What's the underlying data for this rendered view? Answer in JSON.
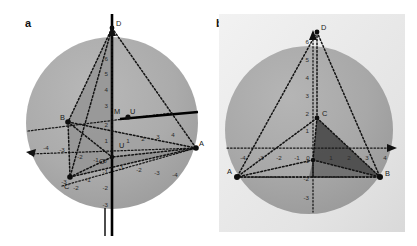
{
  "figure": {
    "caption_panels": [
      "a",
      "b"
    ],
    "background_color": "#ffffff"
  },
  "panels": [
    {
      "id": "a",
      "label": "a",
      "view": "oblique 3D view of a regular tetrahedron inscribed in a sphere",
      "sphere": {
        "fill": "#a9a9a9",
        "center_px": [
          112,
          123
        ],
        "radius_px": 86
      },
      "vertices": [
        {
          "name": "D",
          "label": "D",
          "px": [
            112,
            28
          ]
        },
        {
          "name": "A",
          "label": "A",
          "px": [
            196,
            148
          ]
        },
        {
          "name": "B",
          "label": "B",
          "px": [
            68,
            122
          ]
        },
        {
          "name": "C",
          "label": "C",
          "px": [
            70,
            177
          ]
        },
        {
          "name": "M",
          "label": "M",
          "px": [
            118,
            116
          ]
        },
        {
          "name": "U",
          "label": "U",
          "px": [
            128,
            117
          ]
        },
        {
          "name": "O",
          "label": "O",
          "px": [
            110,
            157
          ]
        },
        {
          "name": "U2",
          "label": "U",
          "px": [
            117,
            145
          ]
        }
      ],
      "axis_ticks": {
        "vertical_positive": [
          "1",
          "2",
          "3",
          "4",
          "5",
          "6"
        ],
        "vertical_negative": [
          "-1",
          "-2",
          "-3"
        ],
        "left_axis": [
          "-4",
          "-3",
          "-2",
          "-1",
          "0"
        ],
        "right_axis": [
          "1",
          "2",
          "3",
          "4"
        ],
        "lower_right_axis": [
          "-1",
          "-2",
          "-3",
          "-4"
        ],
        "origin": "0"
      },
      "solid_axis_color": "#000000",
      "shaded_face_fill": "#8c8c8c"
    },
    {
      "id": "b",
      "label": "b",
      "view": "front 3D view of the same tetrahedron inscribed in the sphere",
      "sphere": {
        "fill": "#a9a9a9",
        "center_px": [
          100,
          130
        ],
        "radius_px": 84
      },
      "backdrop_fill": "#e6e6e6",
      "vertices": [
        {
          "name": "D",
          "label": "D",
          "px": [
            108,
            32
          ]
        },
        {
          "name": "B",
          "label": "B",
          "px": [
            171,
            177
          ]
        },
        {
          "name": "C",
          "label": "C",
          "px": [
            108,
            118
          ]
        },
        {
          "name": "A",
          "label": "A",
          "px": [
            28,
            177
          ]
        }
      ],
      "axis_ticks": {
        "vertical_positive": [
          "1",
          "2",
          "3",
          "4",
          "5",
          "6"
        ],
        "vertical_negative": [
          "-1",
          "-2",
          "-3"
        ],
        "horizontal_negative": [
          "-4",
          "-3",
          "-2",
          "-1"
        ],
        "horizontal_positive": [
          "1",
          "2",
          "3",
          "4"
        ],
        "origin": "0"
      },
      "dark_face_fill": "#4f4f4f",
      "mid_face_fill": "#6f6f6f"
    }
  ]
}
